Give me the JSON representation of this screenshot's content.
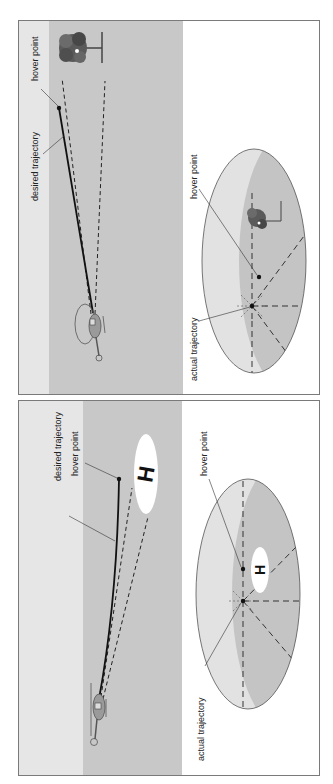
{
  "colors": {
    "sky": "#e6e6e6",
    "ground": "#c8c8c8",
    "ellipse_light": "#e2e2e2",
    "ellipse_dark": "#c4c4c4",
    "line": "#111111",
    "border": "#7a7a7a",
    "helipad": "#ffffff"
  },
  "top_figure": {
    "side_view": {
      "landmark": "tree",
      "labels": {
        "hover_point": "hover point",
        "desired_trajectory": "desired trajectory"
      }
    },
    "top_view": {
      "landmark": "tree",
      "labels": {
        "hover_point": "hover point",
        "actual_trajectory": "actual trajectory"
      }
    }
  },
  "bottom_figure": {
    "side_view": {
      "landmark": "helipad",
      "helipad_letter": "H",
      "labels": {
        "hover_point": "hover point",
        "desired_trajectory": "desired trajectory"
      }
    },
    "top_view": {
      "landmark": "helipad",
      "helipad_letter": "H",
      "labels": {
        "hover_point": "hover point",
        "actual_trajectory": "actual trajectory"
      }
    }
  }
}
